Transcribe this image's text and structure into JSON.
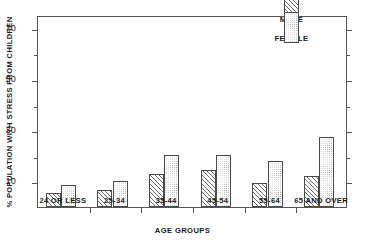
{
  "chart_data": {
    "type": "bar",
    "title": "",
    "subtitle": "",
    "xlabel": "AGE GROUPS",
    "ylabel": "% POPULATION WITH STRESS FROM CHILDREN",
    "categories": [
      "24 OR LESS",
      "25-34",
      "35-44",
      "45-54",
      "55-64",
      "65 AND OVER"
    ],
    "series": [
      {
        "name": "MALE",
        "pattern": "diagonal-hatch",
        "values": [
          5.5,
          6.5,
          13.0,
          14.5,
          9.5,
          12.0
        ]
      },
      {
        "name": "FEMALE",
        "pattern": "stipple-dots",
        "values": [
          8.5,
          10.3,
          20.5,
          20.3,
          18.0,
          27.5
        ]
      }
    ],
    "ylim": [
      0,
      75
    ],
    "yticks_major": [
      10,
      30,
      50,
      70
    ],
    "yticks_minor": [
      20,
      40,
      60
    ],
    "ytick_labels": [
      "10",
      "30",
      "50",
      "70"
    ],
    "grid": false,
    "legend_position": "top-right",
    "axis_color": "#555555",
    "bar_edge_color": "#4a4a4a",
    "background": "#ffffff"
  },
  "legend": {
    "items": [
      {
        "label": "MALE"
      },
      {
        "label": "FEMALE"
      }
    ]
  }
}
